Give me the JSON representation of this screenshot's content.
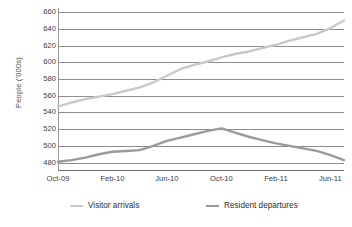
{
  "chart_data": {
    "type": "line",
    "title": "",
    "xlabel": "",
    "ylabel": "People ('000s)",
    "ylim": [
      470,
      665
    ],
    "yticks": [
      660,
      640,
      620,
      600,
      580,
      560,
      540,
      520,
      500,
      480
    ],
    "grid": true,
    "legend_position": "bottom",
    "x_tick_labels": [
      "Oct-09",
      "Feb-10",
      "Jun-10",
      "Oct-10",
      "Feb-11",
      "Jun-11"
    ],
    "x": [
      "Oct-09",
      "Nov-09",
      "Dec-09",
      "Jan-10",
      "Feb-10",
      "Mar-10",
      "Apr-10",
      "May-10",
      "Jun-10",
      "Jul-10",
      "Aug-10",
      "Sep-10",
      "Oct-10",
      "Nov-10",
      "Dec-10",
      "Jan-11",
      "Feb-11",
      "Mar-11",
      "Apr-11",
      "May-11",
      "Jun-11",
      "Jul-11"
    ],
    "series": [
      {
        "name": "Visitor arrivals",
        "color": "#c9c9c9",
        "values": [
          547,
          552,
          556,
          559,
          562,
          566,
          570,
          576,
          584,
          592,
          597,
          601,
          606,
          610,
          613,
          617,
          621,
          626,
          630,
          634,
          641,
          650
        ]
      },
      {
        "name": "Resident departures",
        "color": "#9a9a9a",
        "values": [
          481,
          483,
          486,
          490,
          493,
          494,
          495,
          500,
          506,
          510,
          514,
          518,
          521,
          516,
          511,
          507,
          503,
          500,
          497,
          494,
          489,
          483
        ]
      }
    ]
  },
  "legend": {
    "items": [
      {
        "label": "Visitor arrivals",
        "color": "#c9c9c9"
      },
      {
        "label": "Resident departures",
        "color": "#9a9a9a"
      }
    ]
  },
  "axes": {
    "y_title": "People ('000s)",
    "y_tick_labels": [
      "660",
      "640",
      "620",
      "600",
      "580",
      "560",
      "540",
      "520",
      "500",
      "480"
    ],
    "x_tick_labels": [
      "Oct-09",
      "Feb-10",
      "Jun-10",
      "Oct-10",
      "Feb-11",
      "Jun-11"
    ]
  },
  "colors": {
    "gridline": "#8d8d8d",
    "axis": "#6f6f6f",
    "background": "#ffffff",
    "text": "#3d3d3d"
  }
}
